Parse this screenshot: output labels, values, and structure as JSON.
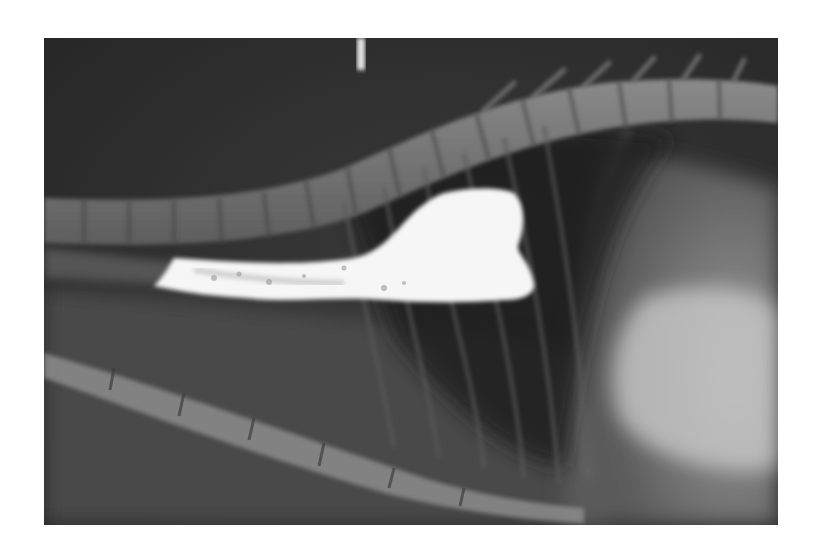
{
  "image": {
    "kind": "radiograph",
    "view": "lateral thoracic radiograph with contrast-filled esophagus",
    "colors": {
      "background": "#ffffff",
      "film_dark": "#2a2a2a",
      "film_mid": "#6a6a6a",
      "bone": "#b5b5b5",
      "contrast": "#fafafa"
    }
  }
}
